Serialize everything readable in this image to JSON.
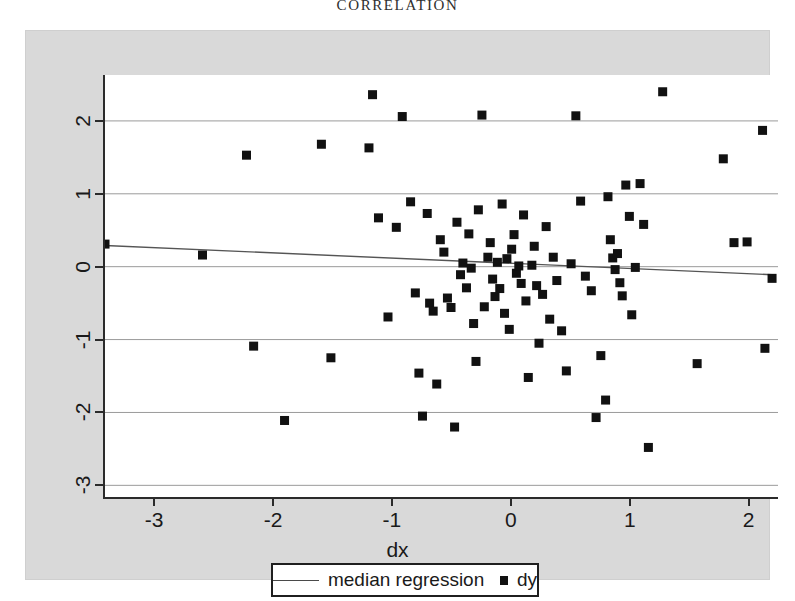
{
  "page": {
    "running_head": "CORRELATION"
  },
  "legend": {
    "line_label": "median regression",
    "marker_label": "dy",
    "line_swatch": "regression-line-swatch",
    "marker_swatch": "dy-marker-swatch"
  },
  "colors": {
    "panel_background": "#d9d9d9",
    "plot_background": "#ffffff",
    "axis": "#2b2b2b",
    "gridline": "#9a9a9a",
    "marker": "#111111",
    "regression_line": "#555555",
    "text": "#1a1a1a"
  },
  "chart_data": {
    "type": "scatter",
    "title": "",
    "xlabel": "dx",
    "ylabel": "",
    "xlim": [
      -3.43,
      2.23
    ],
    "ylim": [
      -3.16,
      2.63
    ],
    "xticks": [
      -3,
      -2,
      -1,
      0,
      1,
      2
    ],
    "xticklabels": [
      "-3",
      "-2",
      "-1",
      "0",
      "1",
      "2"
    ],
    "yticks": [
      2,
      1,
      0,
      -1,
      -2,
      -3
    ],
    "yticklabels": [
      "2",
      "1",
      "0",
      "-1",
      "-2",
      "-3"
    ],
    "grid": "horizontal",
    "legend_position": "below-axis-center",
    "series": [
      {
        "name": "dy",
        "marker": "square",
        "points": [
          [
            -3.43,
            0.31
          ],
          [
            -2.61,
            0.16
          ],
          [
            -2.24,
            1.53
          ],
          [
            -2.18,
            -1.09
          ],
          [
            -1.92,
            -2.11
          ],
          [
            -1.61,
            1.68
          ],
          [
            -1.53,
            -1.25
          ],
          [
            -1.21,
            1.63
          ],
          [
            -1.18,
            2.36
          ],
          [
            -1.13,
            0.67
          ],
          [
            -1.05,
            -0.69
          ],
          [
            -0.98,
            0.54
          ],
          [
            -0.93,
            2.06
          ],
          [
            -0.86,
            0.89
          ],
          [
            -0.82,
            -0.36
          ],
          [
            -0.79,
            -1.46
          ],
          [
            -0.76,
            -2.05
          ],
          [
            -0.72,
            0.73
          ],
          [
            -0.7,
            -0.5
          ],
          [
            -0.67,
            -0.61
          ],
          [
            -0.64,
            -1.61
          ],
          [
            -0.61,
            0.37
          ],
          [
            -0.58,
            0.2
          ],
          [
            -0.55,
            -0.43
          ],
          [
            -0.52,
            -0.56
          ],
          [
            -0.49,
            -2.2
          ],
          [
            -0.47,
            0.61
          ],
          [
            -0.44,
            -0.11
          ],
          [
            -0.42,
            0.05
          ],
          [
            -0.39,
            -0.29
          ],
          [
            -0.37,
            0.45
          ],
          [
            -0.35,
            -0.02
          ],
          [
            -0.33,
            -0.78
          ],
          [
            -0.31,
            -1.3
          ],
          [
            -0.29,
            0.78
          ],
          [
            -0.26,
            2.08
          ],
          [
            -0.24,
            -0.55
          ],
          [
            -0.21,
            0.13
          ],
          [
            -0.19,
            0.33
          ],
          [
            -0.17,
            -0.17
          ],
          [
            -0.15,
            -0.41
          ],
          [
            -0.13,
            0.06
          ],
          [
            -0.11,
            -0.3
          ],
          [
            -0.09,
            0.86
          ],
          [
            -0.07,
            -0.64
          ],
          [
            -0.05,
            0.11
          ],
          [
            -0.03,
            -0.86
          ],
          [
            -0.01,
            0.24
          ],
          [
            0.01,
            0.44
          ],
          [
            0.03,
            -0.09
          ],
          [
            0.05,
            0.01
          ],
          [
            0.07,
            -0.23
          ],
          [
            0.09,
            0.71
          ],
          [
            0.11,
            -0.47
          ],
          [
            0.13,
            -1.52
          ],
          [
            0.16,
            0.02
          ],
          [
            0.18,
            0.28
          ],
          [
            0.2,
            -0.26
          ],
          [
            0.22,
            -1.05
          ],
          [
            0.25,
            -0.38
          ],
          [
            0.28,
            0.55
          ],
          [
            0.31,
            -0.72
          ],
          [
            0.34,
            0.13
          ],
          [
            0.37,
            -0.19
          ],
          [
            0.41,
            -0.88
          ],
          [
            0.45,
            -1.43
          ],
          [
            0.49,
            0.04
          ],
          [
            0.53,
            2.07
          ],
          [
            0.57,
            0.9
          ],
          [
            0.61,
            -0.13
          ],
          [
            0.66,
            -0.33
          ],
          [
            0.7,
            -2.07
          ],
          [
            0.74,
            -1.22
          ],
          [
            0.78,
            -1.83
          ],
          [
            0.8,
            0.96
          ],
          [
            0.82,
            0.37
          ],
          [
            0.84,
            0.12
          ],
          [
            0.86,
            -0.04
          ],
          [
            0.88,
            0.18
          ],
          [
            0.9,
            -0.22
          ],
          [
            0.92,
            -0.4
          ],
          [
            0.95,
            1.12
          ],
          [
            0.98,
            0.69
          ],
          [
            1.0,
            -0.66
          ],
          [
            1.03,
            -0.01
          ],
          [
            1.07,
            1.14
          ],
          [
            1.1,
            0.58
          ],
          [
            1.14,
            -2.48
          ],
          [
            1.26,
            2.4
          ],
          [
            1.55,
            -1.33
          ],
          [
            1.77,
            1.48
          ],
          [
            1.86,
            0.33
          ],
          [
            1.97,
            0.34
          ],
          [
            2.1,
            1.87
          ],
          [
            2.12,
            -1.12
          ],
          [
            2.18,
            -0.16
          ]
        ]
      }
    ],
    "regression": {
      "name": "median regression",
      "x_start": -3.43,
      "y_start": 0.29,
      "x_end": 2.18,
      "y_end": -0.11,
      "slope": -0.071,
      "intercept": 0.046
    }
  }
}
